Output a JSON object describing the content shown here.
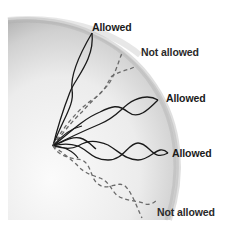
{
  "diagram": {
    "colors": {
      "allowed_wave": "#1a1a1a",
      "not_allowed_wave": "#6a6a6a",
      "sphere_light": "#f7f7f7",
      "sphere_dark": "#b8b8b8",
      "background": "#ffffff"
    },
    "labels": [
      {
        "id": "label-1",
        "text": "Allowed",
        "type": "allowed"
      },
      {
        "id": "label-2",
        "text": "Not allowed",
        "type": "not_allowed"
      },
      {
        "id": "label-3",
        "text": "Allowed",
        "type": "allowed"
      },
      {
        "id": "label-4",
        "text": "Allowed",
        "type": "allowed"
      },
      {
        "id": "label-5",
        "text": "Not allowed",
        "type": "not_allowed"
      }
    ],
    "legend": {
      "solid": "Allowed",
      "dashed": "Not allowed"
    }
  }
}
